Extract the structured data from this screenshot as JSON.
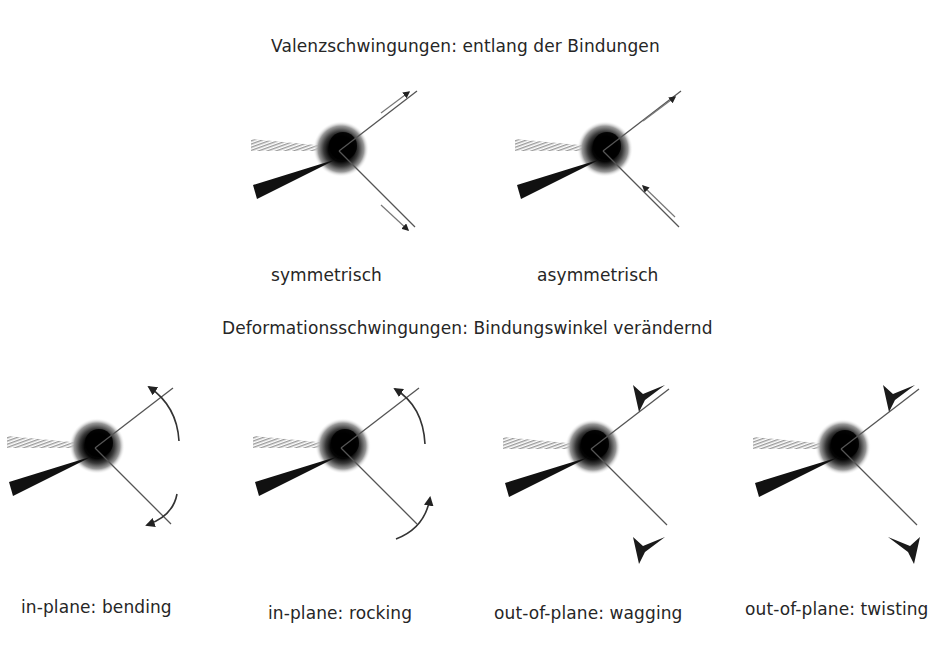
{
  "sections": {
    "valence": {
      "heading": "Valenzschwingungen: entlang der Bindungen",
      "modes": [
        {
          "label": "symmetrisch",
          "arrows": "both-outward"
        },
        {
          "label": "asymmetrisch",
          "arrows": "upper-outward-lower-inward"
        }
      ]
    },
    "deformation": {
      "heading": "Deformationsschwingungen: Bindungswinkel verändernd",
      "modes": [
        {
          "label": "in-plane: bending",
          "arrows": "curved-converging"
        },
        {
          "label": "in-plane: rocking",
          "arrows": "curved-same-direction"
        },
        {
          "label": "out-of-plane: wagging",
          "arrows": "both-into-plane"
        },
        {
          "label": "out-of-plane: twisting",
          "arrows": "opposite-out-of-plane"
        }
      ]
    }
  },
  "colors": {
    "atom": "#000000",
    "bond": "#555555",
    "text": "#262626",
    "background": "#ffffff"
  }
}
